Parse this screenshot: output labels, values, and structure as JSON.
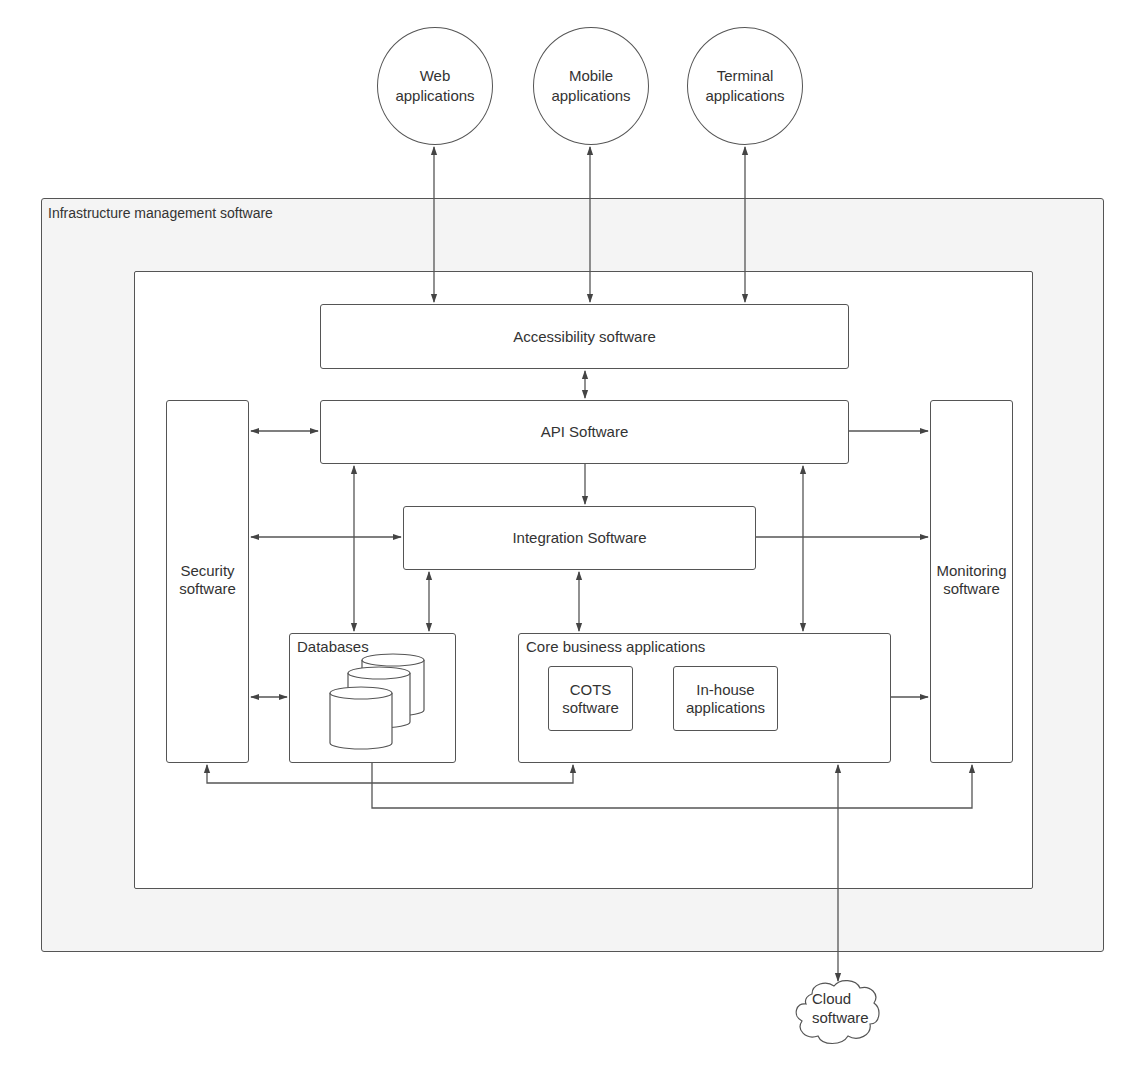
{
  "diagram": {
    "external_clients": [
      {
        "id": "web",
        "label": "Web\napplications"
      },
      {
        "id": "mobile",
        "label": "Mobile\napplications"
      },
      {
        "id": "terminal",
        "label": "Terminal\napplications"
      }
    ],
    "outer_frame": {
      "title": "Infrastructure management software"
    },
    "components": {
      "accessibility": "Accessibility software",
      "api": "API Software",
      "integration": "Integration Software",
      "security": "Security\nsoftware",
      "monitoring": "Monitoring\nsoftware",
      "databases": "Databases",
      "core": "Core business applications",
      "cots": "COTS\nsoftware",
      "inhouse": "In-house\napplications"
    },
    "external_services": {
      "cloud": "Cloud\nsoftware"
    },
    "connections": [
      {
        "from": "Web applications",
        "to": "Accessibility software",
        "direction": "both"
      },
      {
        "from": "Mobile applications",
        "to": "Accessibility software",
        "direction": "both"
      },
      {
        "from": "Terminal applications",
        "to": "Accessibility software",
        "direction": "both"
      },
      {
        "from": "Accessibility software",
        "to": "API Software",
        "direction": "both"
      },
      {
        "from": "Security software",
        "to": "API Software",
        "direction": "both"
      },
      {
        "from": "API Software",
        "to": "Monitoring software",
        "direction": "forward"
      },
      {
        "from": "API Software",
        "to": "Integration Software",
        "direction": "forward"
      },
      {
        "from": "API Software",
        "to": "Databases",
        "direction": "both"
      },
      {
        "from": "API Software",
        "to": "Core business applications",
        "direction": "both"
      },
      {
        "from": "Security software",
        "to": "Integration Software",
        "direction": "both"
      },
      {
        "from": "Integration Software",
        "to": "Monitoring software",
        "direction": "forward"
      },
      {
        "from": "Integration Software",
        "to": "Databases",
        "direction": "both"
      },
      {
        "from": "Integration Software",
        "to": "Core business applications",
        "direction": "both"
      },
      {
        "from": "Security software",
        "to": "Databases",
        "direction": "both"
      },
      {
        "from": "Core business applications",
        "to": "Monitoring software",
        "direction": "forward"
      },
      {
        "from": "Security software",
        "to": "Core business applications",
        "direction": "both"
      },
      {
        "from": "Databases",
        "to": "Monitoring software",
        "direction": "forward"
      },
      {
        "from": "Core business applications",
        "to": "Cloud software",
        "direction": "both"
      }
    ],
    "colors": {
      "stroke": "#555555",
      "outer_fill": "#f4f4f4",
      "inner_fill": "#ffffff",
      "text": "#333333"
    }
  }
}
